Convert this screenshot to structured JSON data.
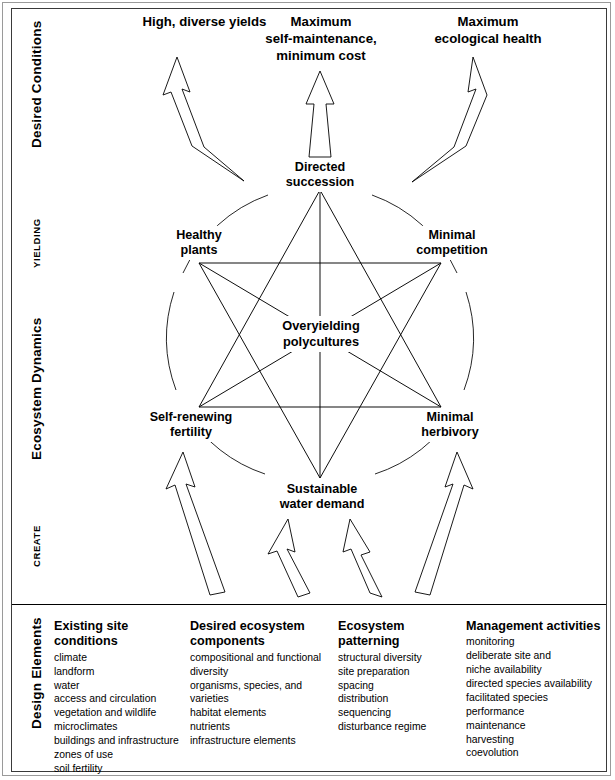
{
  "diagram": {
    "title_bands": [
      {
        "id": "desired-conditions",
        "label": "Desired Conditions",
        "style": "bold"
      },
      {
        "id": "yielding",
        "label": "YIELDING",
        "style": "caps"
      },
      {
        "id": "ecosystem-dynamics",
        "label": "Ecosystem Dynamics",
        "style": "bold"
      },
      {
        "id": "create",
        "label": "CREATE",
        "style": "caps"
      },
      {
        "id": "design-elements",
        "label": "Design Elements",
        "style": "bold"
      }
    ],
    "top_goals": [
      {
        "id": "high-diverse-yields",
        "lines": [
          "High, diverse yields"
        ]
      },
      {
        "id": "maximum-self-maintenance",
        "lines": [
          "Maximum",
          "self-maintenance,",
          "minimum cost"
        ]
      },
      {
        "id": "maximum-ecological-health",
        "lines": [
          "Maximum",
          "ecological health"
        ]
      }
    ],
    "nodes": [
      {
        "id": "directed-succession",
        "lines": [
          "Directed",
          "succession"
        ]
      },
      {
        "id": "healthy-plants",
        "lines": [
          "Healthy",
          "plants"
        ]
      },
      {
        "id": "minimal-competition",
        "lines": [
          "Minimal",
          "competition"
        ]
      },
      {
        "id": "self-renewing-fertility",
        "lines": [
          "Self-renewing",
          "fertility"
        ]
      },
      {
        "id": "minimal-herbivory",
        "lines": [
          "Minimal",
          "herbivory"
        ]
      },
      {
        "id": "sustainable-water-demand",
        "lines": [
          "Sustainable",
          "water demand"
        ]
      }
    ],
    "center_node": {
      "id": "overyielding-polycultures",
      "lines": [
        "Overyielding",
        "polycultures"
      ]
    },
    "design_columns": [
      {
        "id": "existing-site-conditions",
        "heading": "Existing site\nconditions",
        "items": [
          "climate",
          "landform",
          "water",
          "access and circulation",
          "vegetation and wildlife",
          "microclimates",
          "buildings and infrastructure",
          "zones of use",
          "soil fertility"
        ]
      },
      {
        "id": "desired-ecosystem-components",
        "heading": "Desired ecosystem\ncomponents",
        "items": [
          "compositional and functional\n   diversity",
          "organisms, species, and varieties",
          "habitat elements",
          "nutrients",
          "infrastructure elements"
        ]
      },
      {
        "id": "ecosystem-patterning",
        "heading": "Ecosystem patterning",
        "items": [
          "structural diversity",
          "site preparation",
          "spacing",
          "distribution",
          "sequencing",
          "disturbance regime"
        ]
      },
      {
        "id": "management-activities",
        "heading": "Management\nactivities",
        "items": [
          "monitoring",
          "deliberate site and\n   niche availability",
          "directed species availability",
          "facilitated species\n   performance",
          "maintenance",
          "harvesting",
          "coevolution"
        ]
      }
    ],
    "colors": {
      "ink": "#000000",
      "frame_outer": "#9a9a9a",
      "frame_inner": "#3a3a3a",
      "background": "#ffffff"
    }
  }
}
